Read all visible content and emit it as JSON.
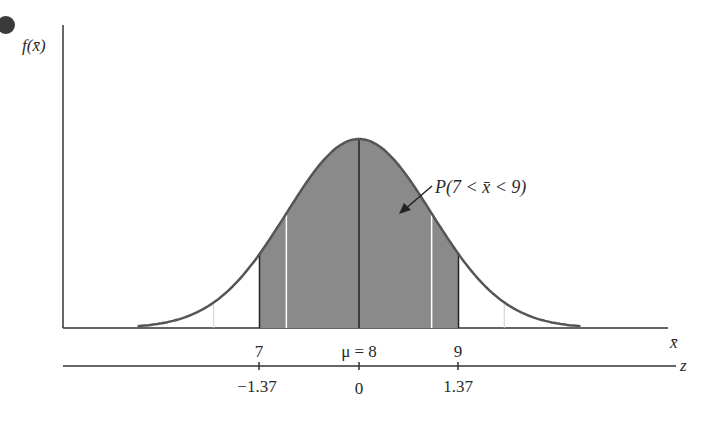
{
  "chart_data": {
    "type": "area",
    "title": "",
    "ylabel": "f(x̄)",
    "xlabel": "x̄",
    "zlabel": "z",
    "mean": 8,
    "std_error": 0.73,
    "shaded_interval": [
      7,
      9
    ],
    "x_axis": {
      "ticks": [
        7,
        8,
        9
      ],
      "tick_labels": [
        "7",
        "μ = 8",
        "9"
      ],
      "label": "x̄"
    },
    "z_axis": {
      "ticks": [
        -1.37,
        0,
        1.37
      ],
      "tick_labels": [
        "−1.37",
        "0",
        "1.37"
      ],
      "label": "z"
    },
    "annotation": "P(7 < x̄ < 9)",
    "grid": false,
    "colors": {
      "shade": "#8a8a8a",
      "curve": "#555555",
      "axis": "#333333"
    }
  },
  "labels": {
    "y_axis": "f(x̄)",
    "x_axis": "x̄",
    "z_axis": "z",
    "annotation": "P(7 < x̄ < 9)",
    "x_tick_7": "7",
    "x_tick_mu": "μ = 8",
    "x_tick_9": "9",
    "z_tick_neg": "−1.37",
    "z_tick_0": "0",
    "z_tick_pos": "1.37"
  }
}
